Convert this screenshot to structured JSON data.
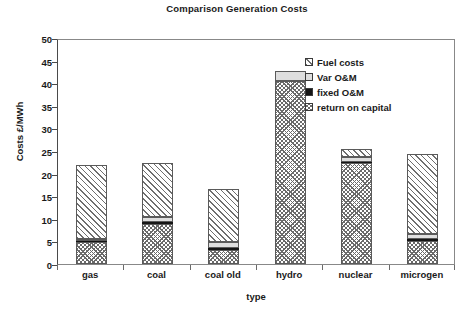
{
  "chart_data": {
    "type": "bar",
    "subtype": "stacked-bar",
    "title": "Comparison Generation Costs",
    "subtitle": "",
    "xlabel": "type",
    "ylabel": "Costs £/MWh",
    "categories": [
      "gas",
      "coal",
      "coal old",
      "hydro",
      "nuclear",
      "microgen"
    ],
    "ylim": [
      0,
      50
    ],
    "yticks": [
      0,
      5,
      10,
      15,
      20,
      25,
      30,
      35,
      40,
      45,
      50
    ],
    "ytick_labels": [
      "0",
      "5",
      "10",
      "15",
      "20",
      "25",
      "30",
      "35",
      "40",
      "45",
      "50"
    ],
    "grid": false,
    "legend_position": "upper-right",
    "stack_order_bottom_to_top": [
      "return on capital",
      "fixed O&M",
      "Var O&M",
      "Fuel costs"
    ],
    "series": [
      {
        "name": "return on capital",
        "pattern": "cross-hatch",
        "color": "#6a6a6a",
        "values": [
          4.8,
          8.9,
          3.2,
          40.5,
          22.3,
          5.2
        ]
      },
      {
        "name": "fixed O&M",
        "pattern": "solid-black",
        "color": "#151515",
        "values": [
          0.3,
          0.3,
          0.3,
          0.0,
          0.3,
          0.3
        ]
      },
      {
        "name": "Var O&M",
        "pattern": "light-solid",
        "color": "#dedede",
        "values": [
          0.5,
          1.2,
          1.4,
          2.1,
          1.1,
          1.2
        ]
      },
      {
        "name": "Fuel costs",
        "pattern": "diagonal-hatch",
        "color": "#6e6e6e",
        "values": [
          16.2,
          12.0,
          11.8,
          0.0,
          1.7,
          17.7
        ]
      }
    ],
    "totals": [
      21.8,
      22.4,
      16.7,
      42.6,
      25.4,
      24.4
    ],
    "annotations": []
  },
  "legend": {
    "items": [
      {
        "label": "Fuel costs",
        "pattern": "diagonal-hatch"
      },
      {
        "label": "Var O&M",
        "pattern": "light-solid"
      },
      {
        "label": "fixed O&M",
        "pattern": "solid-black"
      },
      {
        "label": "return on capital",
        "pattern": "cross-hatch"
      }
    ]
  }
}
